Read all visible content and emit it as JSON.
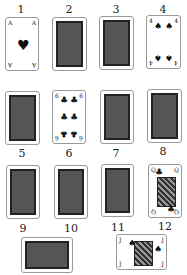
{
  "cards": [
    {
      "n": "1",
      "type": "face",
      "rank": "A",
      "suit": "♥",
      "label": "Ace of hearts"
    },
    {
      "n": "2",
      "type": "back"
    },
    {
      "n": "3",
      "type": "back"
    },
    {
      "n": "4",
      "type": "face",
      "rank": "4",
      "suit": "♠",
      "label": "Four of spades"
    },
    {
      "n": "5",
      "type": "back"
    },
    {
      "n": "6",
      "type": "face",
      "rank": "6",
      "suit": "♣",
      "label": "Six of clubs"
    },
    {
      "n": "7",
      "type": "back"
    },
    {
      "n": "8",
      "type": "back"
    },
    {
      "n": "9",
      "type": "back"
    },
    {
      "n": "10",
      "type": "back"
    },
    {
      "n": "11",
      "type": "back"
    },
    {
      "n": "12",
      "type": "face",
      "rank": "Q",
      "suit": "♣",
      "label": "Queen of clubs"
    },
    {
      "n": "",
      "type": "back",
      "orientation": "horizontal"
    },
    {
      "n": "",
      "type": "face",
      "rank": "J",
      "suit": "♠",
      "label": "Jack of spades",
      "orientation": "horizontal"
    }
  ]
}
